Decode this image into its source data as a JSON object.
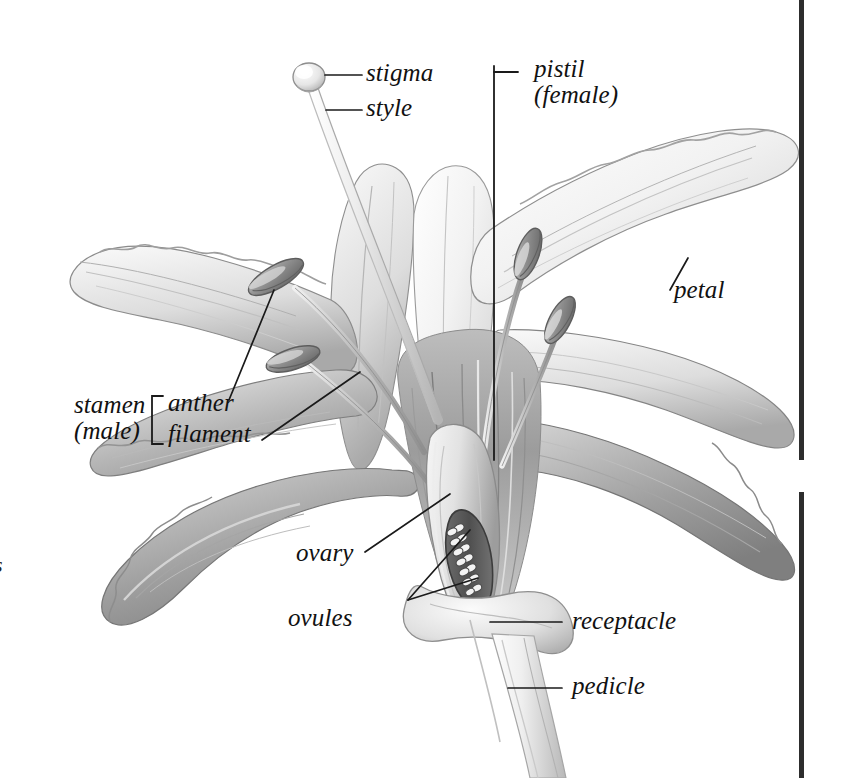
{
  "diagram": {
    "background_color": "#ffffff",
    "ink_color": "#111111",
    "leader_line_color": "#1a1a1a"
  },
  "labels": {
    "stigma": "stigma",
    "style": "style",
    "pistil_line1": "pistil",
    "pistil_line2": "(female)",
    "petal": "petal",
    "stamen_line1": "stamen",
    "stamen_line2": "(male)",
    "anther": "anther",
    "filament": "filament",
    "ovary": "ovary",
    "ovules": "ovules",
    "receptacle": "receptacle",
    "pedicle": "pedicle"
  },
  "edge_fragment": "s",
  "anatomy": {
    "petal_count_visible": 6,
    "anther_count_visible": 4,
    "ovule_count_visible": 18
  },
  "palette": {
    "petal_light": "#fbfbfb",
    "petal_mid": "#d6d6d6",
    "petal_shadow": "#9b9b9b",
    "petal_deep_shadow": "#7d7d7d",
    "anther_fill": "#9a9a9a",
    "anther_dark": "#6f6f6f",
    "ovary_dark": "#5f5f5f",
    "ovule_fill": "#f4f4f4",
    "rule_black": "#2a2a2a"
  }
}
